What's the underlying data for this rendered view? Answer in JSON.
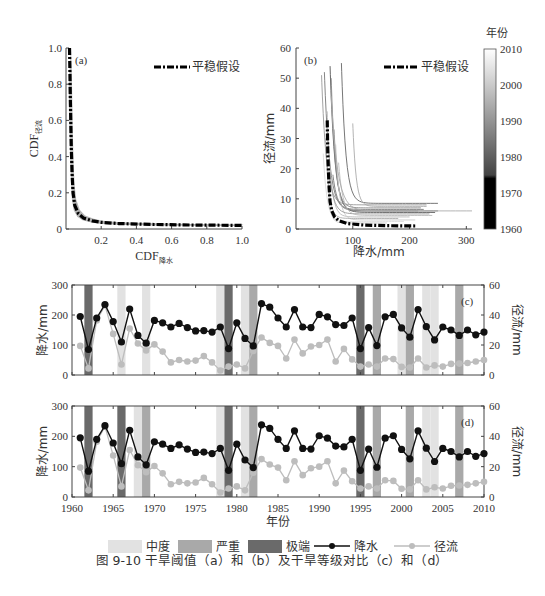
{
  "figure": {
    "caption": "图 9-10   干旱阈值（a）和（b）及干旱等级对比（c）和（d）"
  },
  "legend_bottom": {
    "items": [
      {
        "label": "中度",
        "kind": "box",
        "color": "#e2e2e2"
      },
      {
        "label": "严重",
        "kind": "box",
        "color": "#a9a9a9"
      },
      {
        "label": "极端",
        "kind": "box",
        "color": "#6a6a6a"
      },
      {
        "label": "降水",
        "kind": "line-marker",
        "color": "#111111"
      },
      {
        "label": "径流",
        "kind": "line-marker",
        "color": "#bdbdbd"
      }
    ]
  },
  "chart_data": [
    {
      "id": "a",
      "type": "line",
      "panel_label": "(a)",
      "xlabel": "CDF降水",
      "xlabel_main": "CDF",
      "xlabel_sub": "降水",
      "ylabel": "CDF径流",
      "ylabel_main": "CDF",
      "ylabel_sub": "径流",
      "xlim": [
        0,
        1.0
      ],
      "ylim": [
        0,
        1.0
      ],
      "xticks": [
        "0.2",
        "0.4",
        "0.6",
        "0.8",
        "1.0"
      ],
      "yticks": [
        "0",
        "0.2",
        "0.4",
        "0.6",
        "0.8",
        "1.0"
      ],
      "legend": [
        "平稳假设"
      ],
      "legend_position": "upper right",
      "series": [
        {
          "name": "平稳假设",
          "style": "dash-dot thick black",
          "x": [
            0.02,
            0.025,
            0.03,
            0.035,
            0.04,
            0.05,
            0.07,
            0.1,
            0.15,
            0.2,
            0.3,
            0.5,
            0.7,
            1.0
          ],
          "y": [
            1.0,
            0.7,
            0.45,
            0.3,
            0.2,
            0.13,
            0.085,
            0.06,
            0.045,
            0.037,
            0.03,
            0.025,
            0.022,
            0.02
          ]
        }
      ],
      "note": "Grey band of time-varying curves around the stationary curve"
    },
    {
      "id": "b",
      "type": "line",
      "panel_label": "(b)",
      "xlabel": "降水/mm",
      "ylabel": "径流/mm",
      "xlim": [
        0,
        310
      ],
      "ylim": [
        0,
        60
      ],
      "xticks": [
        "100",
        "200",
        "300"
      ],
      "yticks": [
        "0",
        "10",
        "20",
        "30",
        "40",
        "50",
        "60"
      ],
      "legend": [
        "平稳假设"
      ],
      "colorbar": {
        "title": "年份",
        "ticks": [
          "1960",
          "1970",
          "1980",
          "1990",
          "2000",
          "2010"
        ],
        "range": [
          1960,
          2010
        ]
      },
      "series": [
        {
          "name": "平稳假设",
          "style": "dash-dot thick black",
          "x": [
            55,
            56,
            58,
            60,
            63,
            68,
            75,
            90,
            120,
            160,
            210
          ],
          "y": [
            36,
            25,
            15,
            9,
            6,
            4,
            2.8,
            1.8,
            1.3,
            1.1,
            1.0
          ]
        }
      ],
      "note": "Many grey-shaded threshold curves, one per year 1960-2010, asymptotes x≈45-100 mm, y≈1-9 mm"
    },
    {
      "id": "c",
      "type": "line",
      "panel_label": "(c)",
      "xlabel": "",
      "ylabel_left": "降水/mm",
      "ylabel_right": "径流/mm",
      "xlim": [
        1960,
        2010
      ],
      "ylim_left": [
        0,
        300
      ],
      "ylim_right": [
        0,
        60
      ],
      "yticks_left": [
        "0",
        "100",
        "200",
        "300"
      ],
      "yticks_right": [
        "0",
        "20",
        "40",
        "60"
      ],
      "drought_bands": [
        {
          "year": 1962,
          "level": "极端"
        },
        {
          "year": 1966,
          "level": "中度"
        },
        {
          "year": 1969,
          "level": "中度"
        },
        {
          "year": 1978,
          "level": "中度"
        },
        {
          "year": 1979,
          "level": "极端"
        },
        {
          "year": 1981,
          "level": "中度"
        },
        {
          "year": 1982,
          "level": "严重"
        },
        {
          "year": 1995,
          "level": "极端"
        },
        {
          "year": 1997,
          "level": "严重"
        },
        {
          "year": 2000,
          "level": "中度"
        },
        {
          "year": 2001,
          "level": "严重"
        },
        {
          "year": 2003,
          "level": "中度"
        },
        {
          "year": 2004,
          "level": "中度"
        },
        {
          "year": 2007,
          "level": "严重"
        }
      ]
    },
    {
      "id": "d",
      "type": "line",
      "panel_label": "(d)",
      "xlabel": "年份",
      "ylabel_left": "降水/mm",
      "ylabel_right": "径流/mm",
      "xlim": [
        1960,
        2010
      ],
      "ylim_left": [
        0,
        300
      ],
      "ylim_right": [
        0,
        60
      ],
      "xticks": [
        "1960",
        "1965",
        "1970",
        "1975",
        "1980",
        "1985",
        "1990",
        "1995",
        "2000",
        "2005",
        "2010"
      ],
      "yticks_left": [
        "0",
        "100",
        "200",
        "300"
      ],
      "yticks_right": [
        "0",
        "20",
        "40",
        "60"
      ],
      "drought_bands": [
        {
          "year": 1962,
          "level": "极端"
        },
        {
          "year": 1966,
          "level": "极端"
        },
        {
          "year": 1968,
          "level": "中度"
        },
        {
          "year": 1969,
          "level": "严重"
        },
        {
          "year": 1978,
          "level": "中度"
        },
        {
          "year": 1979,
          "level": "极端"
        },
        {
          "year": 1981,
          "level": "中度"
        },
        {
          "year": 1982,
          "level": "严重"
        },
        {
          "year": 1995,
          "level": "极端"
        },
        {
          "year": 1997,
          "level": "严重"
        },
        {
          "year": 2001,
          "level": "严重"
        },
        {
          "year": 2003,
          "level": "中度"
        },
        {
          "year": 2004,
          "level": "中度"
        },
        {
          "year": 2007,
          "level": "严重"
        }
      ]
    }
  ],
  "timeseries": {
    "years": [
      1961,
      1962,
      1963,
      1964,
      1965,
      1966,
      1967,
      1968,
      1969,
      1970,
      1971,
      1972,
      1973,
      1974,
      1975,
      1976,
      1977,
      1978,
      1979,
      1980,
      1981,
      1982,
      1983,
      1984,
      1985,
      1986,
      1987,
      1988,
      1989,
      1990,
      1991,
      1992,
      1993,
      1994,
      1995,
      1996,
      1997,
      1998,
      1999,
      2000,
      2001,
      2002,
      2003,
      2004,
      2005,
      2006,
      2007,
      2008,
      2009,
      2010
    ],
    "precipitation_mm": [
      195,
      85,
      190,
      235,
      178,
      110,
      220,
      132,
      106,
      182,
      174,
      160,
      172,
      158,
      147,
      148,
      143,
      160,
      88,
      174,
      122,
      97,
      238,
      226,
      190,
      160,
      218,
      160,
      158,
      202,
      194,
      168,
      165,
      190,
      88,
      158,
      98,
      194,
      202,
      157,
      126,
      218,
      161,
      117,
      160,
      150,
      132,
      150,
      134,
      143
    ],
    "runoff_mm": [
      19.4,
      4.4,
      36.4,
      46.4,
      27.4,
      7.0,
      31.0,
      21.0,
      16.4,
      20.4,
      15.6,
      8.4,
      10.0,
      9.0,
      9.6,
      12.6,
      8.4,
      3.0,
      5.6,
      7.0,
      4.4,
      16.0,
      25.0,
      21.4,
      19.4,
      11.0,
      23.6,
      14.4,
      19.0,
      20.0,
      23.6,
      9.0,
      17.4,
      10.4,
      5.6,
      7.0,
      5.6,
      11.0,
      10.6,
      5.4,
      5.0,
      11.0,
      5.0,
      6.4,
      5.6,
      7.4,
      7.6,
      8.0,
      9.0,
      10.0
    ]
  },
  "colors": {
    "moderate": "#e2e2e2",
    "severe": "#a9a9a9",
    "extreme": "#6a6a6a",
    "precip": "#111111",
    "runoff": "#bdbdbd",
    "axis": "#444444"
  }
}
